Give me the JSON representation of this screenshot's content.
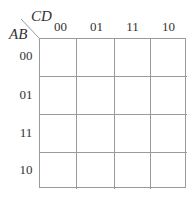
{
  "kmap": {
    "col_variables": "CD",
    "row_variables": "AB",
    "col_labels": [
      "00",
      "01",
      "11",
      "10"
    ],
    "row_labels": [
      "00",
      "01",
      "11",
      "10"
    ],
    "cells": [
      [
        "",
        "",
        "",
        ""
      ],
      [
        "",
        "",
        "",
        ""
      ],
      [
        "",
        "",
        "",
        ""
      ],
      [
        "",
        "",
        "",
        ""
      ]
    ],
    "line_color": "#9a9a9a",
    "text_color": "#333333"
  }
}
